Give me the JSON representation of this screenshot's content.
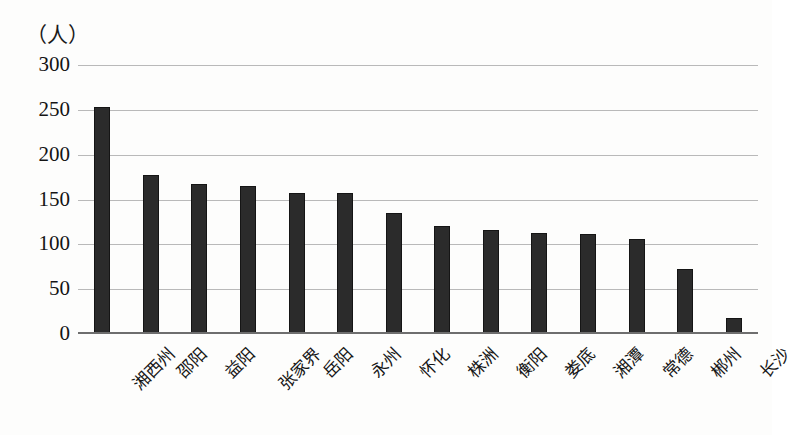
{
  "chart_data": {
    "type": "bar",
    "title": "",
    "subtitle": "",
    "xlabel": "",
    "ylabel": "（人）",
    "unit_label": "（人）",
    "ylim": [
      0,
      300
    ],
    "ytick_values": [
      0,
      50,
      100,
      150,
      200,
      250,
      300
    ],
    "ytick_labels": [
      "0",
      "50",
      "100",
      "150",
      "200",
      "250",
      "300"
    ],
    "grid": true,
    "grid_axis": "y",
    "legend": false,
    "legend_position": "none",
    "bar_color": "#2b2b2b",
    "categories": [
      "湘西州",
      "邵阳",
      "益阳",
      "张家界",
      "岳阳",
      "永州",
      "怀化",
      "株洲",
      "衡阳",
      "娄底",
      "湘潭",
      "常德",
      "郴州",
      "长沙"
    ],
    "values": [
      253,
      177,
      167,
      165,
      157,
      157,
      135,
      120,
      116,
      113,
      111,
      106,
      73,
      18
    ],
    "series": [
      {
        "name": "人数",
        "values": [
          253,
          177,
          167,
          165,
          157,
          157,
          135,
          120,
          116,
          113,
          111,
          106,
          73,
          18
        ]
      }
    ],
    "annotations": []
  }
}
